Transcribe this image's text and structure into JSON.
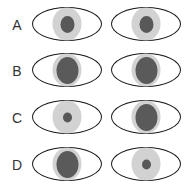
{
  "diagram": {
    "colors": {
      "outline": "#1a1a1a",
      "iris": "#d2d2d2",
      "pupil": "#585858",
      "background": "#ffffff"
    },
    "rows": [
      {
        "label": "A",
        "left_pupil": "medium",
        "right_pupil": "medium"
      },
      {
        "label": "B",
        "left_pupil": "large",
        "right_pupil": "large"
      },
      {
        "label": "C",
        "left_pupil": "small",
        "right_pupil": "large"
      },
      {
        "label": "D",
        "left_pupil": "large",
        "right_pupil": "small"
      }
    ]
  }
}
